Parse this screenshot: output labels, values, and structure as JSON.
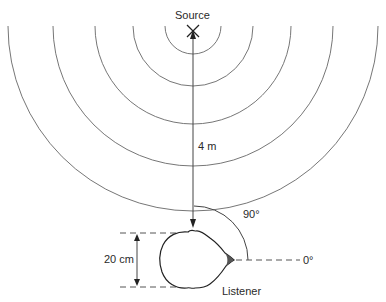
{
  "diagram": {
    "source_label": "Source",
    "distance_label": "4 m",
    "angle_90_label": "90°",
    "angle_0_label": "0°",
    "head_width_label": "20 cm",
    "listener_label": "Listener"
  },
  "elements": {
    "source_marker": "x-icon",
    "wavefronts": 7,
    "colors": {
      "line": "#555555",
      "text": "#2a2a2a",
      "background": "#ffffff"
    }
  }
}
